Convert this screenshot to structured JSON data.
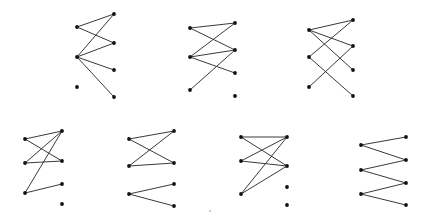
{
  "figure": {
    "edge_color": "#3a3a3a",
    "node_color": "#111111",
    "graphs": [
      {
        "id": "g1",
        "left": [
          [
            77,
            27
          ],
          [
            77,
            57
          ],
          [
            77,
            87
          ]
        ],
        "right": [
          [
            114,
            14
          ],
          [
            114,
            43
          ],
          [
            114,
            70
          ],
          [
            114,
            97
          ]
        ],
        "edges": [
          [
            0,
            0
          ],
          [
            0,
            1
          ],
          [
            1,
            0
          ],
          [
            1,
            1
          ],
          [
            1,
            2
          ],
          [
            1,
            3
          ]
        ]
      },
      {
        "id": "g2",
        "left": [
          [
            190,
            28
          ],
          [
            190,
            57
          ],
          [
            190,
            90
          ]
        ],
        "right": [
          [
            235,
            23
          ],
          [
            235,
            50
          ],
          [
            235,
            73
          ],
          [
            235,
            96
          ]
        ],
        "edges": [
          [
            0,
            0
          ],
          [
            0,
            1
          ],
          [
            1,
            0
          ],
          [
            1,
            1
          ],
          [
            1,
            2
          ],
          [
            2,
            1
          ]
        ]
      },
      {
        "id": "g3",
        "left": [
          [
            309,
            30
          ],
          [
            309,
            57
          ],
          [
            309,
            87
          ]
        ],
        "right": [
          [
            353,
            20
          ],
          [
            353,
            46
          ],
          [
            353,
            70
          ],
          [
            353,
            96
          ]
        ],
        "edges": [
          [
            0,
            0
          ],
          [
            0,
            1
          ],
          [
            0,
            2
          ],
          [
            1,
            0
          ],
          [
            1,
            3
          ],
          [
            2,
            1
          ]
        ]
      },
      {
        "id": "g4",
        "left": [
          [
            25,
            139
          ],
          [
            25,
            163
          ],
          [
            25,
            193
          ]
        ],
        "right": [
          [
            62,
            131
          ],
          [
            62,
            161
          ],
          [
            62,
            184
          ],
          [
            62,
            204
          ]
        ],
        "edges": [
          [
            0,
            0
          ],
          [
            0,
            1
          ],
          [
            1,
            0
          ],
          [
            1,
            1
          ],
          [
            2,
            0
          ],
          [
            2,
            2
          ]
        ]
      },
      {
        "id": "g5",
        "left": [
          [
            129,
            139
          ],
          [
            129,
            166
          ],
          [
            129,
            194
          ]
        ],
        "right": [
          [
            174,
            131
          ],
          [
            174,
            163
          ],
          [
            174,
            184
          ],
          [
            174,
            206
          ]
        ],
        "edges": [
          [
            0,
            0
          ],
          [
            0,
            1
          ],
          [
            1,
            0
          ],
          [
            1,
            1
          ],
          [
            2,
            2
          ],
          [
            2,
            3
          ]
        ]
      },
      {
        "id": "g6",
        "left": [
          [
            241,
            137
          ],
          [
            241,
            161
          ],
          [
            241,
            194
          ]
        ],
        "right": [
          [
            287,
            137
          ],
          [
            287,
            166
          ],
          [
            287,
            187
          ],
          [
            287,
            205
          ]
        ],
        "edges": [
          [
            0,
            0
          ],
          [
            0,
            1
          ],
          [
            1,
            0
          ],
          [
            1,
            1
          ],
          [
            2,
            0
          ],
          [
            2,
            1
          ]
        ]
      },
      {
        "id": "g7",
        "left": [
          [
            361,
            145
          ],
          [
            361,
            170
          ],
          [
            361,
            194
          ]
        ],
        "right": [
          [
            406,
            137
          ],
          [
            406,
            160
          ],
          [
            406,
            183
          ],
          [
            406,
            205
          ]
        ],
        "edges": [
          [
            0,
            0
          ],
          [
            0,
            1
          ],
          [
            1,
            1
          ],
          [
            1,
            2
          ],
          [
            2,
            2
          ],
          [
            2,
            3
          ]
        ]
      }
    ],
    "artifacts": [
      [
        210,
        211
      ]
    ]
  }
}
